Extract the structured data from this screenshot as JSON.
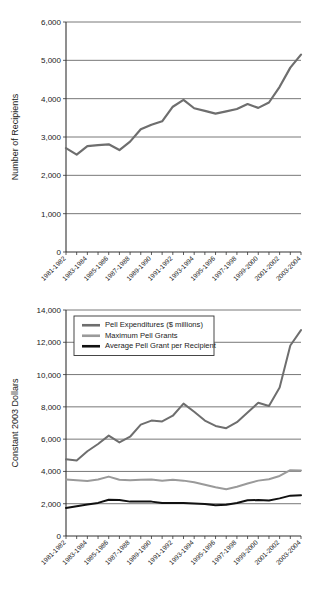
{
  "figures": [
    {
      "id": "recipients",
      "name": "pell-grant-recipients-chart",
      "ylabel": "Number of Recipients",
      "xlabel": ""
    },
    {
      "id": "dollars",
      "name": "pell-grant-constant-dollars-chart",
      "ylabel": "Constant 2003 Dollars",
      "xlabel": ""
    }
  ],
  "chart_data": [
    {
      "type": "line",
      "title": "",
      "xlabel": "",
      "ylabel": "Number of Recipients",
      "ylim": [
        0,
        6000
      ],
      "yticks": [
        0,
        1000,
        2000,
        3000,
        4000,
        5000,
        6000
      ],
      "ytick_labels": [
        "0",
        "1,000",
        "2,000",
        "3,000",
        "4,000",
        "5,000",
        "6,000"
      ],
      "grid": true,
      "legend": null,
      "categories": [
        "1981-1982",
        "1982-1983",
        "1983-1984",
        "1984-1985",
        "1985-1986",
        "1986-1987",
        "1987-1988",
        "1988-1989",
        "1989-1990",
        "1990-1991",
        "1991-1992",
        "1992-1993",
        "1993-1994",
        "1994-1995",
        "1995-1996",
        "1996-1997",
        "1997-1998",
        "1998-1999",
        "1999-2000",
        "2000-2001",
        "2001-2002",
        "2002-2003",
        "2003-2004"
      ],
      "xtick_labels": [
        "1981-1982",
        "1983-1984",
        "1985-1986",
        "1987-1988",
        "1989-1990",
        "1991-1992",
        "1993-1994",
        "1995-1996",
        "1997-1998",
        "1999-2000",
        "2001-2002",
        "2003-2004"
      ],
      "series": [
        {
          "name": "Number of Recipients",
          "color": "#6e6e6e",
          "values": [
            2710,
            2540,
            2760,
            2790,
            2810,
            2660,
            2880,
            3200,
            3320,
            3410,
            3790,
            3970,
            3750,
            3680,
            3610,
            3670,
            3730,
            3860,
            3760,
            3900,
            4310,
            4810,
            5150
          ]
        }
      ]
    },
    {
      "type": "line",
      "title": "",
      "xlabel": "",
      "ylabel": "Constant 2003 Dollars",
      "ylim": [
        0,
        14000
      ],
      "yticks": [
        0,
        2000,
        4000,
        6000,
        8000,
        10000,
        12000,
        14000
      ],
      "ytick_labels": [
        "0",
        "2,000",
        "4,000",
        "6,000",
        "8,000",
        "10,000",
        "12,000",
        "14,000"
      ],
      "grid": true,
      "legend": "upper-left",
      "categories": [
        "1981-1982",
        "1982-1983",
        "1983-1984",
        "1984-1985",
        "1985-1986",
        "1986-1987",
        "1987-1988",
        "1988-1989",
        "1989-1990",
        "1990-1991",
        "1991-1992",
        "1992-1993",
        "1993-1994",
        "1994-1995",
        "1995-1996",
        "1996-1997",
        "1997-1998",
        "1998-1999",
        "1999-2000",
        "2000-2001",
        "2001-2002",
        "2002-2003",
        "2003-2004"
      ],
      "xtick_labels": [
        "1981-1982",
        "1983-1984",
        "1985-1986",
        "1987-1988",
        "1989-1990",
        "1991-1992",
        "1993-1994",
        "1995-1996",
        "1997-1998",
        "1999-2000",
        "2001-2002",
        "2003-2004"
      ],
      "series": [
        {
          "name": "Pell Expenditures ($ millions)",
          "color": "#6e6e6e",
          "values": [
            4750,
            4680,
            5250,
            5700,
            6220,
            5800,
            6150,
            6900,
            7150,
            7100,
            7450,
            8200,
            7700,
            7150,
            6820,
            6680,
            7050,
            7650,
            8250,
            8050,
            9200,
            11800,
            12750
          ]
        },
        {
          "name": "Maximum Pell Grants",
          "color": "#9a9a9a",
          "values": [
            3500,
            3450,
            3400,
            3500,
            3680,
            3480,
            3450,
            3480,
            3500,
            3420,
            3480,
            3430,
            3330,
            3180,
            3020,
            2900,
            3050,
            3250,
            3430,
            3520,
            3720,
            4080,
            4060
          ]
        },
        {
          "name": "Average Pell Grant per Recipient",
          "color": "#111111",
          "values": [
            1740,
            1850,
            1950,
            2050,
            2250,
            2230,
            2130,
            2140,
            2130,
            2040,
            2040,
            2040,
            2020,
            1980,
            1900,
            1930,
            2050,
            2210,
            2230,
            2200,
            2330,
            2500,
            2530
          ]
        }
      ]
    }
  ]
}
